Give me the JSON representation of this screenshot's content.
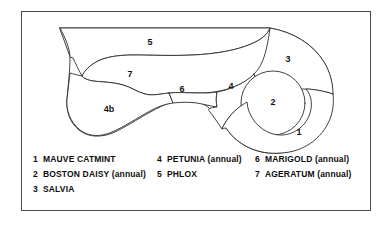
{
  "frame": {
    "border_color": "#4a4a4a",
    "background": "#ffffff"
  },
  "plan": {
    "stroke_color": "#2b2b2b",
    "fill_color": "#ffffff",
    "regions": [
      {
        "number": "1",
        "plant": "MAUVE CATMINT",
        "label_x": 278,
        "label_y": 122
      },
      {
        "number": "2",
        "plant": "BOSTON DAISY (annual)",
        "label_x": 252,
        "label_y": 92
      },
      {
        "number": "3",
        "plant": "SALVIA",
        "label_x": 267,
        "label_y": 49
      },
      {
        "number": "4",
        "plant": "PETUNIA (annual)",
        "label_x": 210,
        "label_y": 76
      },
      {
        "number": "4b",
        "plant": "PETUNIA (annual)",
        "label_x": 88,
        "label_y": 99
      },
      {
        "number": "5",
        "plant": "PHLOX",
        "label_x": 129,
        "label_y": 32
      },
      {
        "number": "6",
        "plant": "MARIGOLD (annual)",
        "label_x": 161,
        "label_y": 79
      },
      {
        "number": "7",
        "plant": "AGERATUM (annual)",
        "label_x": 109,
        "label_y": 64
      }
    ]
  },
  "legend": {
    "columns": [
      {
        "items": [
          {
            "number": "1",
            "name": "MAUVE CATMINT"
          },
          {
            "number": "2",
            "name": "BOSTON DAISY (annual)"
          },
          {
            "number": "3",
            "name": "SALVIA"
          }
        ]
      },
      {
        "items": [
          {
            "number": "4",
            "name": "PETUNIA (annual)"
          },
          {
            "number": "5",
            "name": "PHLOX"
          }
        ]
      },
      {
        "items": [
          {
            "number": "6",
            "name": "MARIGOLD (annual)"
          },
          {
            "number": "7",
            "name": "AGERATUM (annual)"
          }
        ]
      }
    ]
  }
}
